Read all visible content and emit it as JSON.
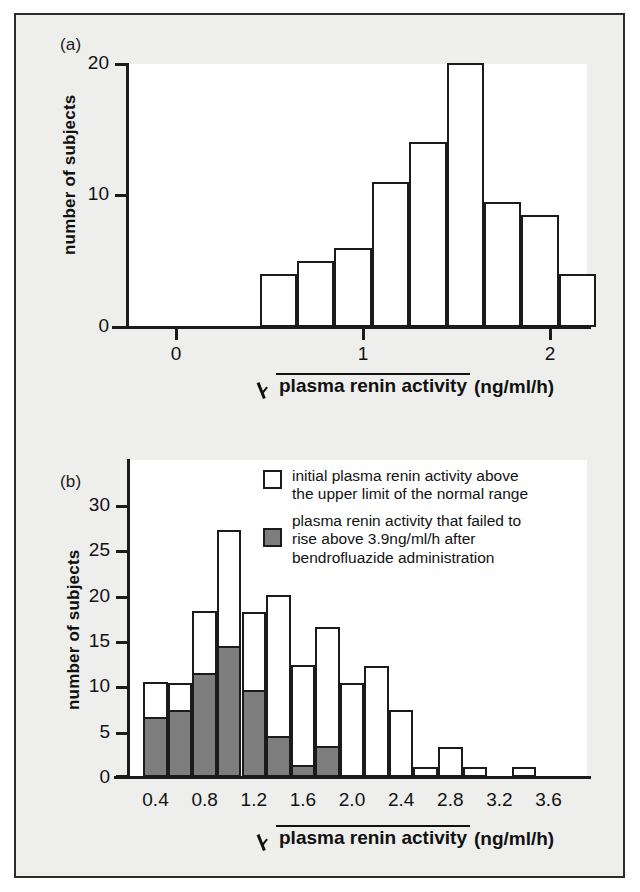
{
  "figure": {
    "background_color": "#eeeeec",
    "frame_color": "#2b2b2b",
    "plot_background": "#ffffff",
    "open_fill": "#ffffff",
    "solid_fill": "#7e7e7e",
    "ink_color": "#1b1b1b"
  },
  "panel_a": {
    "label": "(a)",
    "ylabel": "number of subjects",
    "xtitle_radicand": "plasma renin activity",
    "xtitle_tail": "(ng/ml/h)",
    "ytick_labels": [
      "0",
      "10",
      "20"
    ],
    "xtick_labels": [
      "0",
      "1",
      "2"
    ]
  },
  "panel_b": {
    "label": "(b)",
    "ylabel": "number of subjects",
    "xtitle_radicand": "plasma renin activity",
    "xtitle_tail": "(ng/ml/h)",
    "ytick_labels": [
      "0",
      "5",
      "10",
      "15",
      "20",
      "25",
      "30"
    ],
    "xtick_labels": [
      "0.4",
      "0.8",
      "1.2",
      "1.6",
      "2.0",
      "2.4",
      "2.8",
      "3.2",
      "3.6"
    ],
    "legend": [
      {
        "swatch": "open",
        "text": "initial plasma renin activity above\nthe upper limit of the normal range"
      },
      {
        "swatch": "solid",
        "text": "plasma renin activity that failed to\nrise above 3.9ng/ml/h after\nbendrofluazide administration"
      }
    ]
  },
  "chart_data": [
    {
      "id": "panel_a",
      "type": "bar",
      "title": "(a)",
      "xlabel": "√(plasma renin activity) (ng/ml/h)",
      "ylabel": "number of subjects",
      "ylim": [
        0,
        20
      ],
      "yticks": [
        0,
        10,
        20
      ],
      "xlim": [
        -0.27,
        2.37
      ],
      "xticks": [
        0,
        1,
        2
      ],
      "bin_width": 0.2,
      "grid": false,
      "legend": "none",
      "bin_starts": [
        0.45,
        0.65,
        0.85,
        1.05,
        1.25,
        1.45,
        1.65,
        1.85,
        2.05
      ],
      "bin_ends": [
        0.65,
        0.85,
        1.05,
        1.25,
        1.45,
        1.65,
        1.85,
        2.05,
        2.25
      ],
      "values": [
        4,
        5,
        6,
        11,
        14,
        20,
        9.5,
        8.5,
        4
      ]
    },
    {
      "id": "panel_b",
      "type": "bar",
      "stacked": true,
      "title": "(b)",
      "xlabel": "√(plasma renin activity) (ng/ml/h)",
      "ylabel": "number of subjects",
      "ylim": [
        0,
        33
      ],
      "yticks": [
        0,
        5,
        10,
        15,
        20,
        25,
        30
      ],
      "xlim": [
        0.2,
        3.8
      ],
      "xticks": [
        0.4,
        0.8,
        1.2,
        1.6,
        2.0,
        2.4,
        2.8,
        3.2,
        3.6
      ],
      "bin_width": 0.2,
      "grid": false,
      "legend_position": "upper right inside plot",
      "bin_starts": [
        0.3,
        0.5,
        0.7,
        0.9,
        1.1,
        1.3,
        1.5,
        1.7,
        1.9,
        2.1,
        2.3,
        2.5,
        2.7,
        2.9,
        3.1,
        3.3,
        3.5
      ],
      "bin_ends": [
        0.5,
        0.7,
        0.9,
        1.1,
        1.3,
        1.5,
        1.7,
        1.9,
        2.1,
        2.3,
        2.5,
        2.7,
        2.9,
        3.1,
        3.3,
        3.5,
        3.7
      ],
      "series": [
        {
          "name": "initial plasma renin activity above the upper limit of the normal range",
          "fill": "open",
          "totals": [
            10.5,
            10.4,
            18.3,
            27.2,
            18.2,
            20.1,
            12.4,
            16.5,
            10.4,
            12.3,
            7.4,
            1.1,
            3.3,
            1.1,
            0,
            1.1,
            0
          ]
        },
        {
          "name": "plasma renin activity that failed to rise above 3.9ng/ml/h after bendrofluazide administration",
          "fill": "solid",
          "values": [
            6.6,
            7.4,
            11.5,
            14.4,
            9.6,
            4.5,
            1.3,
            3.4,
            0,
            0,
            0,
            0,
            0,
            0,
            0,
            0,
            0
          ]
        }
      ]
    }
  ]
}
